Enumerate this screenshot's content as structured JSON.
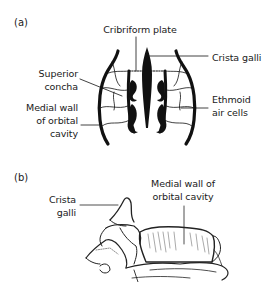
{
  "panel_a": {
    "label": "(a)",
    "labels": {
      "cribriform_plate": "Cribriform plate",
      "crista_galli": "Crista galli",
      "superior_concha_1": "Superior",
      "superior_concha_2": "concha",
      "medial_wall_1": "Medial wall",
      "medial_wall_2": "of orbital",
      "medial_wall_3": "cavity",
      "ethmoid_1": "Ethmoid",
      "ethmoid_2": "air cells"
    }
  },
  "panel_b": {
    "label": "(b)",
    "labels": {
      "crista_galli_1": "Crista",
      "crista_galli_2": "galli",
      "medial_wall_1": "Medial wall of",
      "medial_wall_2": "orbital cavity"
    }
  }
}
